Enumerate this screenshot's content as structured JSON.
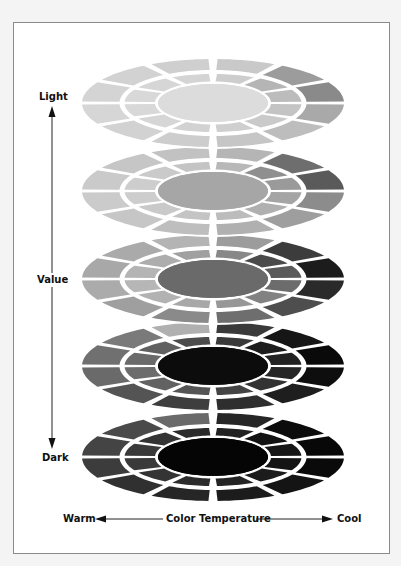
{
  "figure": {
    "axis_vertical": {
      "top_label": "Light",
      "middle_label": "Value",
      "bottom_label": "Dark"
    },
    "axis_horizontal": {
      "left_label": "Warm",
      "middle_label": "Color Temperature",
      "right_label": "Cool"
    },
    "disc_geometry": {
      "center_x": 213,
      "outer_rx": 131,
      "outer_ry": 44,
      "ring_rx": 91,
      "ring_ry": 31,
      "core_rx": 55,
      "core_ry": 19,
      "gap": 4,
      "sectors": 12
    },
    "discs": [
      {
        "name": "disc-lightest",
        "cy": 103,
        "core": "#dcdcdc",
        "outer": [
          "#a9a9a9",
          "#bdbdbd",
          "#c6c6c6",
          "#cdcdcd",
          "#d2d2d2",
          "#d6d6d6",
          "#d4d4d4",
          "#d2d2d2",
          "#cfcfcf",
          "#c9c9c9",
          "#9c9c9c",
          "#8a8a8a"
        ],
        "inner": [
          "#c4c4c4",
          "#cacaca",
          "#cfcfcf",
          "#d2d2d2",
          "#d6d6d6",
          "#d8d8d8",
          "#d8d8d8",
          "#d6d6d6",
          "#d4d4d4",
          "#cdcdcd",
          "#b5b5b5",
          "#bcbcbc"
        ]
      },
      {
        "name": "disc-light",
        "cy": 191,
        "core": "#a6a6a6",
        "outer": [
          "#8c8c8c",
          "#9e9e9e",
          "#b0b0b0",
          "#bebebe",
          "#c6c6c6",
          "#cbcbcb",
          "#cacaca",
          "#c6c6c6",
          "#c2c2c2",
          "#b5b5b5",
          "#6e6e6e",
          "#5a5a5a"
        ],
        "inner": [
          "#a5a5a5",
          "#b0b0b0",
          "#bcbcbc",
          "#c4c4c4",
          "#c9c9c9",
          "#cdcdcd",
          "#cdcdcd",
          "#cacaca",
          "#c4c4c4",
          "#b8b8b8",
          "#8f8f8f",
          "#9a9a9a"
        ]
      },
      {
        "name": "disc-middle",
        "cy": 279,
        "core": "#6a6a6a",
        "outer": [
          "#2a2a2a",
          "#4e4e4e",
          "#6e6e6e",
          "#8a8a8a",
          "#9f9f9f",
          "#ababab",
          "#a8a8a8",
          "#aaaaaa",
          "#b4b4b4",
          "#9c9c9c",
          "#3c3c3c",
          "#1c1c1c"
        ],
        "inner": [
          "#6c6c6c",
          "#828282",
          "#979797",
          "#a8a8a8",
          "#b2b2b2",
          "#b6b6b6",
          "#b4b4b4",
          "#adadad",
          "#a0a0a0",
          "#888888",
          "#4a4a4a",
          "#5a5a5a"
        ]
      },
      {
        "name": "disc-dark",
        "cy": 366,
        "core": "#0c0c0c",
        "outer": [
          "#0e0e0e",
          "#1e1e1e",
          "#2e2e2e",
          "#3e3e3e",
          "#545454",
          "#6a6a6a",
          "#707070",
          "#7a7a7a",
          "#b0b0b0",
          "#3a3a3a",
          "#161616",
          "#0a0a0a"
        ],
        "inner": [
          "#262626",
          "#333333",
          "#444444",
          "#555555",
          "#626262",
          "#6c6c6c",
          "#6a6a6a",
          "#606060",
          "#4c4c4c",
          "#3a3a3a",
          "#1c1c1c",
          "#222222"
        ]
      },
      {
        "name": "disc-darkest",
        "cy": 457,
        "core": "#050505",
        "outer": [
          "#0a0a0a",
          "#141414",
          "#1c1c1c",
          "#262626",
          "#303030",
          "#3c3c3c",
          "#444444",
          "#4a4a4a",
          "#6a6a6a",
          "#262626",
          "#0c0c0c",
          "#080808"
        ],
        "inner": [
          "#141414",
          "#1c1c1c",
          "#242424",
          "#2c2c2c",
          "#343434",
          "#3a3a3a",
          "#3a3a3a",
          "#343434",
          "#2a2a2a",
          "#222222",
          "#121212",
          "#161616"
        ]
      }
    ],
    "colors": {
      "frame_border": "#8a8a8a",
      "background": "#f4f4f4",
      "panel": "#ffffff",
      "text": "#111111",
      "arrow": "#222222"
    }
  }
}
